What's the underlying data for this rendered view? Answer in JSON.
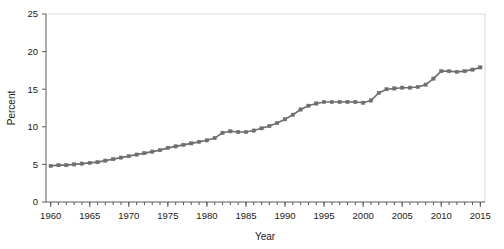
{
  "chart_data": {
    "type": "line",
    "title": "",
    "xlabel": "Year",
    "ylabel": "Percent",
    "xlim": [
      1959.4,
      2015.6
    ],
    "ylim": [
      0,
      25
    ],
    "grid": false,
    "legend": null,
    "marker": "square",
    "series_color": "#6e6e6e",
    "y_ticks": [
      0,
      5,
      10,
      15,
      20,
      25
    ],
    "y_tick_labels": [
      "0",
      "5",
      "10",
      "15",
      "20",
      "25"
    ],
    "x_ticks": [
      1960,
      1965,
      1970,
      1975,
      1980,
      1985,
      1990,
      1995,
      2000,
      2005,
      2010,
      2015
    ],
    "x_tick_labels": [
      "1960",
      "1965",
      "1970",
      "1975",
      "1980",
      "1985",
      "1990",
      "1995",
      "2000",
      "2005",
      "2010",
      "2015"
    ],
    "x_minor_tick_step": 1,
    "x": [
      1960,
      1961,
      1962,
      1963,
      1964,
      1965,
      1966,
      1967,
      1968,
      1969,
      1970,
      1971,
      1972,
      1973,
      1974,
      1975,
      1976,
      1977,
      1978,
      1979,
      1980,
      1981,
      1982,
      1983,
      1984,
      1985,
      1986,
      1987,
      1988,
      1989,
      1990,
      1991,
      1992,
      1993,
      1994,
      1995,
      1996,
      1997,
      1998,
      1999,
      2000,
      2001,
      2002,
      2003,
      2004,
      2005,
      2006,
      2007,
      2008,
      2009,
      2010,
      2011,
      2012,
      2013,
      2014,
      2015
    ],
    "values": [
      4.8,
      4.9,
      4.9,
      5.0,
      5.1,
      5.2,
      5.3,
      5.5,
      5.7,
      5.9,
      6.1,
      6.3,
      6.5,
      6.7,
      6.9,
      7.2,
      7.4,
      7.6,
      7.8,
      8.0,
      8.2,
      8.5,
      9.2,
      9.4,
      9.3,
      9.3,
      9.5,
      9.8,
      10.1,
      10.5,
      11.0,
      11.6,
      12.3,
      12.8,
      13.1,
      13.3,
      13.3,
      13.3,
      13.3,
      13.3,
      13.2,
      13.5,
      14.5,
      15.0,
      15.1,
      15.2,
      15.2,
      15.3,
      15.6,
      16.4,
      17.4,
      17.4,
      17.3,
      17.4,
      17.6,
      17.9
    ],
    "units": "percent"
  },
  "axes": {
    "y_axis_title": "Percent",
    "x_axis_title": "Year"
  }
}
